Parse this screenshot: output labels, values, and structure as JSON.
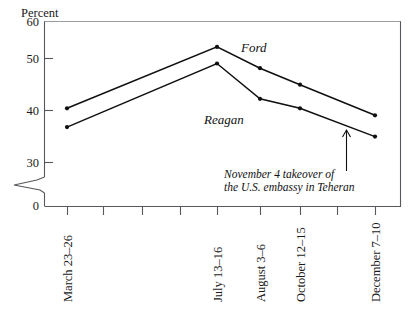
{
  "chart_data": {
    "type": "line",
    "title": "",
    "xlabel": "",
    "ylabel": "Percent",
    "ylim": [
      30,
      60
    ],
    "yticks": [
      30,
      40,
      50,
      60
    ],
    "axis_break": true,
    "axis_break_baseline": 0,
    "grid": false,
    "legend_position": "inline-labels",
    "categories": [
      "March 23–26",
      "July 13–16",
      "August 3–6",
      "October 12–15",
      "December 7–10"
    ],
    "x_positions": [
      67,
      217,
      260,
      300,
      375
    ],
    "unlabeled_ticks": [
      103,
      142,
      180,
      337
    ],
    "series": [
      {
        "name": "Ford",
        "values": [
          41.5,
          54.5,
          50,
          46.5,
          40
        ]
      },
      {
        "name": "Reagan",
        "values": [
          37.5,
          51,
          43.5,
          41.5,
          35.5
        ]
      }
    ],
    "annotations": [
      {
        "name": "hostage-crisis-note",
        "line1": "November 4 takeover of",
        "line2": "the U.S. embassy in Teheran",
        "arrow": true
      }
    ]
  },
  "axis": {
    "y_title": "Percent",
    "y_tick_labels": [
      "60",
      "50",
      "40",
      "30",
      "0"
    ]
  },
  "series_labels": {
    "ford": "Ford",
    "reagan": "Reagan"
  },
  "annotation": {
    "line1": "November 4 takeover of",
    "line2": "the U.S. embassy in Teheran"
  },
  "x_tick_labels": [
    "March 23–26",
    "July 13–16",
    "August 3–6",
    "October 12–15",
    "December 7–10"
  ]
}
